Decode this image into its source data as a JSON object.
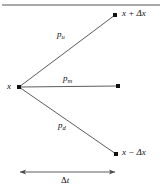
{
  "figure": {
    "background_color": "#ffffff",
    "line_color": "#4a4a4a",
    "rule_color": "#8c8c8c",
    "text_color": "#111111",
    "top_rule": {
      "name": "horizontal-rule",
      "x1": 2,
      "x2": 160,
      "y": 5
    }
  },
  "nodes": {
    "origin": {
      "label": "x",
      "x": 19,
      "y": 87,
      "label_x": 7,
      "label_y": 83
    },
    "up": {
      "label_base": "x",
      "label_op": "+",
      "label_delta": "Δx",
      "label_full": "x + Δx",
      "x": 115,
      "y": 15,
      "label_x": 122,
      "label_y": 10
    },
    "middle": {
      "label": "",
      "x": 118,
      "y": 86
    },
    "down": {
      "label_base": "x",
      "label_op": "−",
      "label_delta": "Δx",
      "label_full": "x − Δx",
      "x": 116,
      "y": 154,
      "label_x": 122,
      "label_y": 149
    }
  },
  "branches": [
    {
      "name": "branch-up",
      "symbol": "p",
      "subscript": "u",
      "label_full": "p_u",
      "from": "origin",
      "to": "up",
      "label_x": 57,
      "label_y": 31
    },
    {
      "name": "branch-middle",
      "symbol": "p",
      "subscript": "m",
      "label_full": "p_m",
      "from": "origin",
      "to": "middle",
      "label_x": 63,
      "label_y": 75
    },
    {
      "name": "branch-down",
      "symbol": "p",
      "subscript": "d",
      "label_full": "p_d",
      "from": "origin",
      "to": "down",
      "label_x": 58,
      "label_y": 122
    }
  ],
  "time_axis": {
    "name": "delta-t-arrow",
    "label_symbol": "Δ",
    "label_var": "t",
    "label_full": "Δt",
    "x1": 18,
    "x2": 117,
    "y": 172,
    "label_x": 61,
    "label_y": 176
  }
}
